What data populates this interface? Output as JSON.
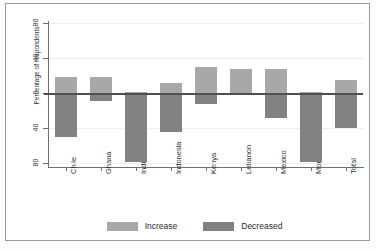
{
  "chart_data": {
    "type": "bar",
    "title": "",
    "xlabel": "",
    "ylabel": "Percentage of respondents",
    "ylim": [
      -80,
      80
    ],
    "yticks": [
      80,
      40,
      0,
      40,
      80
    ],
    "ytick_values": [
      80,
      40,
      0,
      -40,
      -80
    ],
    "grid": true,
    "legend_position": "bottom",
    "categories": [
      "Chile",
      "Ghana",
      "India",
      "Indonesia",
      "Kenya",
      "Lebanon",
      "Mexico",
      "Morocco",
      "Total"
    ],
    "series": [
      {
        "name": "Increase",
        "color": "#a8a8a8",
        "values": [
          18,
          18,
          1,
          11,
          30,
          27,
          28,
          1,
          15
        ]
      },
      {
        "name": "Decreased",
        "color": "#828282",
        "values": [
          -50,
          -9,
          -79,
          -45,
          -13,
          -2,
          -28,
          -79,
          -40
        ]
      }
    ]
  },
  "legend": {
    "items": [
      {
        "label": "Increase",
        "swatch": "increase-swatch"
      },
      {
        "label": "Decreased",
        "swatch": "decreased-swatch"
      }
    ]
  },
  "axis": {
    "y_label": "Percentage of respondents",
    "y_tick_labels": [
      "80",
      "40",
      "0",
      "40",
      "80"
    ],
    "x_tick_labels": [
      "Chile",
      "Ghana",
      "India",
      "Indonesia",
      "Kenya",
      "Lebanon",
      "Mexico",
      "Morocco",
      "Total"
    ]
  }
}
